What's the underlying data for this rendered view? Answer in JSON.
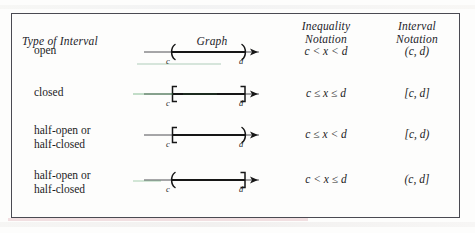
{
  "table": {
    "headers": {
      "type_of_interval": "Type of Interval",
      "graph": "Graph",
      "inequality_notation_line1": "Inequality",
      "inequality_notation_line2": "Notation",
      "interval_notation_line1": "Interval",
      "interval_notation_line2": "Notation"
    },
    "endpoint_labels": {
      "left": "c",
      "right": "d"
    },
    "rows": [
      {
        "type_line1": "open",
        "type_line2": "",
        "graph": {
          "left_bracket": "(",
          "right_bracket": ")",
          "left_closed": false,
          "right_closed": false
        },
        "inequality": "c < x < d",
        "interval": "(c, d)"
      },
      {
        "type_line1": "closed",
        "type_line2": "",
        "graph": {
          "left_bracket": "[",
          "right_bracket": "]",
          "left_closed": true,
          "right_closed": true
        },
        "inequality": "c ≤ x ≤ d",
        "interval": "[c, d]"
      },
      {
        "type_line1": "half-open or",
        "type_line2": "half-closed",
        "graph": {
          "left_bracket": "[",
          "right_bracket": ")",
          "left_closed": true,
          "right_closed": false
        },
        "inequality": "c ≤ x < d",
        "interval": "[c, d)"
      },
      {
        "type_line1": "half-open or",
        "type_line2": "half-closed",
        "graph": {
          "left_bracket": "(",
          "right_bracket": "]",
          "left_closed": false,
          "right_closed": true
        },
        "inequality": "c < x ≤ d",
        "interval": "(c, d]"
      }
    ]
  },
  "colors": {
    "ink": "#1c1c1c",
    "border": "#4a4a52",
    "paper": "#fdfdfc",
    "scan_tint_green": "#3c9650"
  }
}
